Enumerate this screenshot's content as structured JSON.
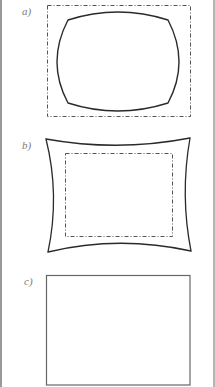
{
  "figure": {
    "panels": [
      {
        "id": "a",
        "label": "a)",
        "description": "Barrel-distorted image (solid) inside rectangular frame (dash-dot)"
      },
      {
        "id": "b",
        "label": "b)",
        "description": "Pincushion-distorted outline (solid) around rectangular frame (dash-dot)"
      },
      {
        "id": "c",
        "label": "c)",
        "description": "Undistorted rectangle"
      }
    ]
  },
  "colors": {
    "stroke": "#2a2a2a",
    "dash": "#555555",
    "label": "#7a7a7a",
    "border": "#9a9a9a"
  }
}
